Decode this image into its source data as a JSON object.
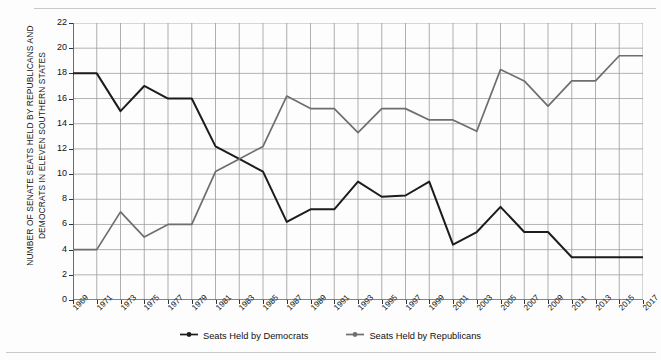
{
  "chart_data": {
    "type": "line",
    "title": "",
    "subtitle": "",
    "xlabel": "",
    "ylabel": "NUMBER OF SENATE SEATS HELD BY REPUBLICANS AND DEMOCRATS IN ELEVEN SOUTHERN STATES",
    "xlim": [
      1969,
      2017
    ],
    "ylim": [
      0,
      22
    ],
    "ytick_step": 2,
    "xtick_step": 2,
    "grid": true,
    "legend_position": "bottom",
    "categories": [
      "1969",
      "1971",
      "1973",
      "1975",
      "1977",
      "1979",
      "1981",
      "1983",
      "1985",
      "1987",
      "1989",
      "1991",
      "1993",
      "1995",
      "1997",
      "1999",
      "2001",
      "2003",
      "2005",
      "2007",
      "2009",
      "2011",
      "2013",
      "2015",
      "2017"
    ],
    "yticks": [
      "0",
      "2",
      "4",
      "6",
      "8",
      "10",
      "12",
      "14",
      "16",
      "18",
      "20",
      "22"
    ],
    "series": [
      {
        "name": "Seats Held by Democrats",
        "color": "#1c1c1c",
        "values": [
          18,
          18,
          15,
          17,
          16,
          16,
          12.2,
          11.2,
          10.2,
          6.2,
          7.2,
          7.2,
          9.4,
          8.2,
          8.3,
          9.4,
          4.4,
          5.4,
          7.4,
          5.4,
          5.4,
          3.4,
          3.4,
          3.4,
          3.4
        ]
      },
      {
        "name": "Seats Held by Republicans",
        "color": "#6e6e6e",
        "values": [
          4,
          4,
          7,
          5,
          6,
          6,
          10.2,
          11.2,
          12.2,
          16.2,
          15.2,
          15.2,
          13.3,
          15.2,
          15.2,
          14.3,
          14.3,
          13.4,
          18.3,
          17.4,
          15.4,
          17.4,
          17.4,
          19.4,
          19.4
        ]
      }
    ]
  },
  "legend": {
    "items": [
      {
        "label": "Seats Held by Democrats",
        "color": "#1c1c1c",
        "icon": "line-marker-icon"
      },
      {
        "label": "Seats Held by Republicans",
        "color": "#6e6e6e",
        "icon": "line-marker-icon"
      }
    ]
  }
}
